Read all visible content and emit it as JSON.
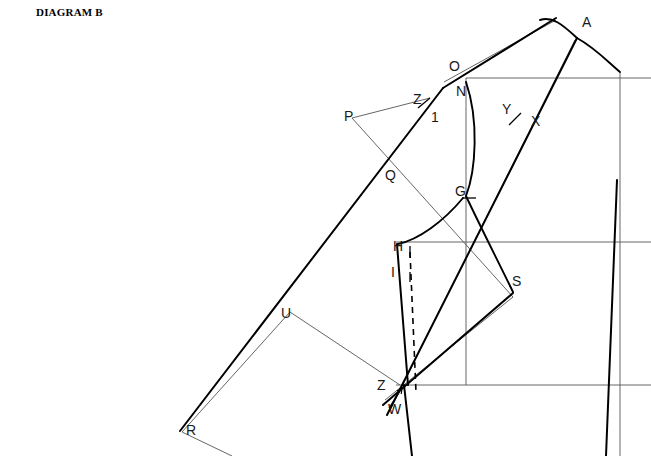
{
  "title": "DIAGRAM B",
  "domain_note": "garment pattern drafting construction diagram",
  "colors": {
    "ink": "#000000",
    "construction": "#555555",
    "label": "#1a1a1a",
    "background": "#ffffff"
  },
  "labels": [
    {
      "id": "A",
      "text": "A",
      "x": 582,
      "y": 27
    },
    {
      "id": "O",
      "text": "O",
      "x": 449,
      "y": 71
    },
    {
      "id": "N",
      "text": "N",
      "x": 456,
      "y": 96
    },
    {
      "id": "P",
      "text": "P",
      "x": 344,
      "y": 121
    },
    {
      "id": "Z1",
      "text": "Z",
      "x": 413,
      "y": 104
    },
    {
      "id": "one",
      "text": "1",
      "x": 431,
      "y": 122
    },
    {
      "id": "Y",
      "text": "Y",
      "x": 502,
      "y": 114
    },
    {
      "id": "X",
      "text": "X",
      "x": 531,
      "y": 126
    },
    {
      "id": "Q",
      "text": "Q",
      "x": 385,
      "y": 180
    },
    {
      "id": "G",
      "text": "G",
      "x": 455,
      "y": 196
    },
    {
      "id": "H",
      "text": "H",
      "x": 393,
      "y": 251
    },
    {
      "id": "I",
      "text": "I",
      "x": 391,
      "y": 277
    },
    {
      "id": "S",
      "text": "S",
      "x": 512,
      "y": 286
    },
    {
      "id": "U",
      "text": "U",
      "x": 281,
      "y": 318
    },
    {
      "id": "Z2",
      "text": "Z",
      "x": 377,
      "y": 390
    },
    {
      "id": "W",
      "text": "W",
      "x": 388,
      "y": 414
    },
    {
      "id": "R",
      "text": "R",
      "x": 186,
      "y": 435
    }
  ],
  "geometry": {
    "construction_lines": [
      {
        "name": "neck-horizontal",
        "x1": 466,
        "y1": 78,
        "x2": 651,
        "y2": 78
      },
      {
        "name": "chest-horizontal",
        "x1": 396,
        "y1": 242,
        "x2": 651,
        "y2": 242
      },
      {
        "name": "waist-horizontal",
        "x1": 396,
        "y1": 385,
        "x2": 651,
        "y2": 385
      },
      {
        "name": "center-vertical",
        "x1": 466,
        "y1": 78,
        "x2": 466,
        "y2": 385
      },
      {
        "name": "right-vertical",
        "x1": 620,
        "y1": 72,
        "x2": 620,
        "y2": 456
      },
      {
        "name": "p-to-z",
        "x1": 352,
        "y1": 118,
        "x2": 430,
        "y2": 98
      },
      {
        "name": "p-to-s",
        "x1": 352,
        "y1": 118,
        "x2": 513,
        "y2": 297
      },
      {
        "name": "u-to-z",
        "x1": 290,
        "y1": 312,
        "x2": 400,
        "y2": 385
      },
      {
        "name": "r-to-u",
        "x1": 182,
        "y1": 432,
        "x2": 290,
        "y2": 312
      },
      {
        "name": "r-to-bottom",
        "x1": 182,
        "y1": 432,
        "x2": 232,
        "y2": 456
      },
      {
        "name": "inner-shoulder",
        "x1": 444,
        "y1": 82,
        "x2": 556,
        "y2": 20
      },
      {
        "name": "inner-front-edge",
        "x1": 575,
        "y1": 40,
        "x2": 390,
        "y2": 410
      },
      {
        "name": "inner-side-seam",
        "x1": 513,
        "y1": 297,
        "x2": 385,
        "y2": 400
      }
    ],
    "heavy_lines": [
      {
        "name": "shoulder-o-to-peak",
        "x1": 443,
        "y1": 88,
        "x2": 556,
        "y2": 18
      },
      {
        "name": "long-diagonal-q-r",
        "x1": 443,
        "y1": 88,
        "x2": 180,
        "y2": 431
      },
      {
        "name": "front-edge-a-w",
        "x1": 577,
        "y1": 38,
        "x2": 387,
        "y2": 415
      },
      {
        "name": "side-seam-s-w",
        "x1": 513,
        "y1": 293,
        "x2": 383,
        "y2": 405
      },
      {
        "name": "i-to-z-vertical",
        "x1": 399,
        "y1": 270,
        "x2": 408,
        "y2": 385
      },
      {
        "name": "h-to-i",
        "x1": 397,
        "y1": 244,
        "x2": 399,
        "y2": 270
      },
      {
        "name": "lower-front",
        "x1": 404,
        "y1": 385,
        "x2": 412,
        "y2": 456
      },
      {
        "name": "right-side-seam",
        "x1": 617,
        "y1": 180,
        "x2": 606,
        "y2": 456
      }
    ],
    "curves": [
      {
        "name": "armhole-n-to-g",
        "d": "M 466,82 C 479,120 476,170 466,196"
      },
      {
        "name": "armhole-g-to-s",
        "d": "M 466,196 C 482,230 500,265 513,292"
      },
      {
        "name": "underarm-g-h",
        "d": "M 463,198 C 443,222 418,240 398,244"
      },
      {
        "name": "neckline-a",
        "d": "M 577,38 C 595,48 606,60 620,72"
      },
      {
        "name": "shoulder-cap",
        "d": "M 540,20 C 552,16 562,24 577,38"
      }
    ],
    "dashed_lines": [
      {
        "name": "dart-guide",
        "x1": 410,
        "y1": 252,
        "x2": 416,
        "y2": 392
      }
    ],
    "tick_marks": [
      {
        "name": "tick-z1",
        "x1": 418,
        "y1": 108,
        "x2": 430,
        "y2": 98
      },
      {
        "name": "tick-yx",
        "x1": 509,
        "y1": 125,
        "x2": 521,
        "y2": 113
      },
      {
        "name": "tick-g",
        "x1": 462,
        "y1": 198,
        "x2": 476,
        "y2": 198
      },
      {
        "name": "tick-h",
        "x1": 410,
        "y1": 246,
        "x2": 410,
        "y2": 258
      },
      {
        "name": "tick-i",
        "x1": 410,
        "y1": 272,
        "x2": 410,
        "y2": 282
      }
    ],
    "arrow": {
      "name": "w-pointer",
      "x1": 389,
      "y1": 408,
      "x2": 402,
      "y2": 388
    }
  }
}
